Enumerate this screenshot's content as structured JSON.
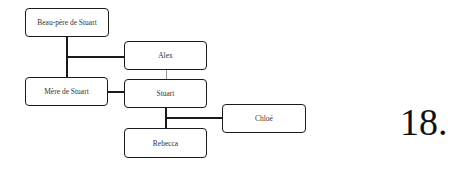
{
  "diagram": {
    "type": "family-tree",
    "nodes": {
      "stepfather": "Beau-père de Stuart",
      "alex": "Alex",
      "mother": "Mère de Stuart",
      "stuart": "Stuart",
      "chloe": "Chloé",
      "rebecca": "Rebecca"
    },
    "edges": [
      {
        "from": "Beau-père de Stuart",
        "to": "Mère de Stuart"
      },
      {
        "from": "Beau-père de Stuart",
        "to": "Alex"
      },
      {
        "from": "Alex",
        "to": "Stuart"
      },
      {
        "from": "Mère de Stuart",
        "to": "Stuart"
      },
      {
        "from": "Stuart",
        "to": "Rebecca"
      },
      {
        "from": "Stuart",
        "to": "Chloé"
      }
    ],
    "question_number": "18."
  }
}
